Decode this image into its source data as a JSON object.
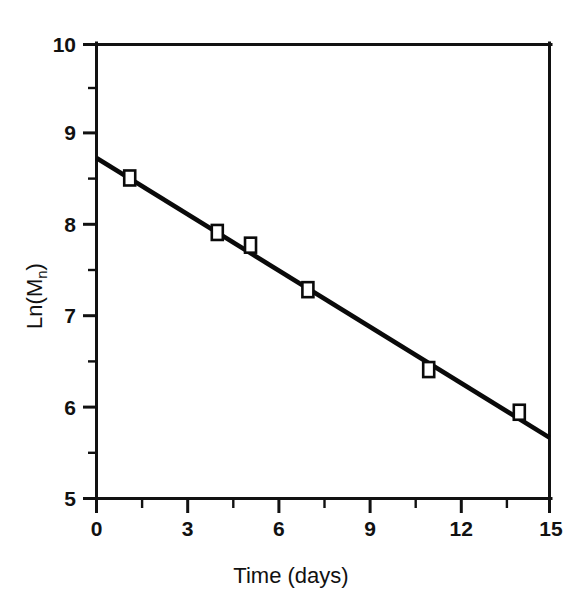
{
  "chart_data": {
    "type": "scatter",
    "title": "",
    "xlabel": "Time (days)",
    "ylabel": "Ln(Mn)",
    "ylabel_base": "Ln(M",
    "ylabel_sub": "n",
    "ylabel_close": ")",
    "xlim": [
      0,
      15
    ],
    "ylim": [
      5,
      10
    ],
    "xticks": [
      0,
      3,
      6,
      9,
      12,
      15
    ],
    "yticks": [
      5,
      6,
      7,
      8,
      9,
      10
    ],
    "xtick_labels": [
      "0",
      "3",
      "6",
      "9",
      "12",
      "15"
    ],
    "ytick_labels": [
      "5",
      "6",
      "7",
      "8",
      "9",
      "10"
    ],
    "xminor_ticks": [
      1.5,
      4.5,
      7.5,
      10.5,
      13.5
    ],
    "yminor_ticks": [
      5.5,
      6.5,
      7.5,
      8.5,
      9.5
    ],
    "grid": false,
    "legend": null,
    "marker": "open-square",
    "marker_color": "#ffffff",
    "marker_edge_color": "#0a0a0a",
    "line_color": "#0a0a0a",
    "series": [
      {
        "name": "Ln(Mn) data",
        "x": [
          1.1,
          4.0,
          5.1,
          7.0,
          11.0,
          14.0
        ],
        "y": [
          8.53,
          7.93,
          7.79,
          7.3,
          6.42,
          5.95
        ]
      }
    ],
    "fit_line": {
      "name": "linear fit",
      "x": [
        0,
        15
      ],
      "y": [
        8.75,
        5.67
      ],
      "slope": -0.205,
      "intercept": 8.75
    }
  }
}
